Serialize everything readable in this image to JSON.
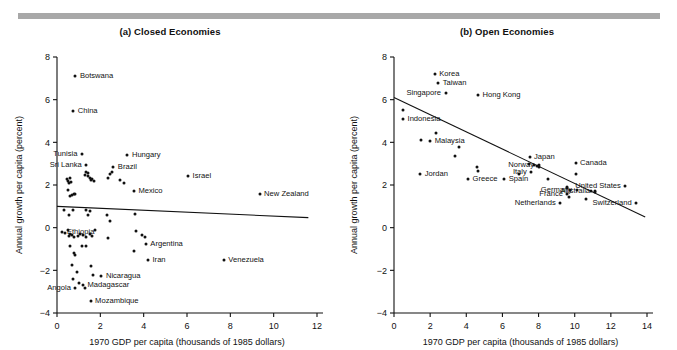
{
  "figure": {
    "top_rule_color": "#a8a8a8",
    "axis_color": "#111111",
    "point_color": "#111111"
  },
  "chart_data": [
    {
      "type": "scatter",
      "panel": "a",
      "title": "(a) Closed Economies",
      "xlabel": "1970 GDP per capita (thousands of 1985 dollars)",
      "ylabel": "Annual growth per capita (percent)",
      "xlim": [
        0,
        12
      ],
      "ylim": [
        -4,
        8
      ],
      "xticks": [
        0,
        2,
        4,
        6,
        8,
        10,
        12
      ],
      "yticks": [
        -4,
        -2,
        0,
        2,
        4,
        6,
        8
      ],
      "xtick_labels": [
        "0",
        "2",
        "4",
        "6",
        "8",
        "10",
        "12"
      ],
      "ytick_labels": [
        "-4",
        "-2",
        "0",
        "2",
        "4",
        "6",
        "8"
      ],
      "grid": false,
      "legend": "none",
      "trendline": {
        "x0": 0,
        "y0": 1.0,
        "x1": 11.6,
        "y1": 0.47
      },
      "labeled_points": [
        {
          "name": "Botswana",
          "x": 0.85,
          "y": 7.1,
          "side": "right"
        },
        {
          "name": "China",
          "x": 0.75,
          "y": 5.45,
          "side": "right"
        },
        {
          "name": "Tunisia",
          "x": 1.15,
          "y": 3.45,
          "side": "left"
        },
        {
          "name": "Sri Lanka",
          "x": 1.35,
          "y": 2.95,
          "side": "left"
        },
        {
          "name": "Hungary",
          "x": 3.25,
          "y": 3.4,
          "side": "right"
        },
        {
          "name": "Brazil",
          "x": 2.6,
          "y": 2.85,
          "side": "right"
        },
        {
          "name": "Mexico",
          "x": 3.55,
          "y": 1.7,
          "side": "right"
        },
        {
          "name": "Israel",
          "x": 6.05,
          "y": 2.4,
          "side": "right"
        },
        {
          "name": "New Zealand",
          "x": 9.35,
          "y": 1.6,
          "side": "right"
        },
        {
          "name": "Ethiopia",
          "x": 0.25,
          "y": -0.2,
          "side": "right"
        },
        {
          "name": "Argentina",
          "x": 4.1,
          "y": -0.75,
          "side": "right"
        },
        {
          "name": "Iran",
          "x": 4.2,
          "y": -1.5,
          "side": "right"
        },
        {
          "name": "Venezuela",
          "x": 7.7,
          "y": -1.5,
          "side": "right"
        },
        {
          "name": "Nicaragua",
          "x": 2.05,
          "y": -2.25,
          "side": "right"
        },
        {
          "name": "Madagascar",
          "x": 1.2,
          "y": -2.7,
          "side": "right"
        },
        {
          "name": "Angola",
          "x": 0.85,
          "y": -2.85,
          "side": "left"
        },
        {
          "name": "Mozambique",
          "x": 1.55,
          "y": -3.45,
          "side": "right"
        }
      ],
      "unlabeled_points": [
        [
          0.45,
          2.3
        ],
        [
          0.5,
          2.2
        ],
        [
          0.6,
          2.35
        ],
        [
          0.55,
          2.1
        ],
        [
          0.65,
          2.15
        ],
        [
          0.5,
          1.75
        ],
        [
          0.7,
          1.55
        ],
        [
          0.78,
          1.6
        ],
        [
          0.85,
          1.6
        ],
        [
          0.62,
          1.5
        ],
        [
          1.35,
          2.6
        ],
        [
          1.42,
          2.4
        ],
        [
          1.5,
          2.35
        ],
        [
          1.55,
          2.25
        ],
        [
          1.62,
          2.3
        ],
        [
          1.45,
          2.55
        ],
        [
          1.7,
          2.2
        ],
        [
          1.3,
          2.45
        ],
        [
          2.35,
          2.35
        ],
        [
          2.45,
          2.5
        ],
        [
          2.55,
          2.6
        ],
        [
          3.1,
          2.1
        ],
        [
          2.9,
          2.25
        ],
        [
          0.3,
          0.85
        ],
        [
          0.55,
          0.6
        ],
        [
          0.72,
          0.85
        ],
        [
          1.35,
          0.85
        ],
        [
          1.5,
          0.8
        ],
        [
          1.45,
          0.6
        ],
        [
          2.3,
          0.6
        ],
        [
          2.45,
          0.3
        ],
        [
          3.6,
          0.65
        ],
        [
          0.35,
          -0.25
        ],
        [
          0.55,
          -0.4
        ],
        [
          0.62,
          -0.3
        ],
        [
          0.7,
          -0.35
        ],
        [
          0.8,
          -0.45
        ],
        [
          0.95,
          -0.4
        ],
        [
          1.05,
          -0.3
        ],
        [
          1.2,
          -0.35
        ],
        [
          1.35,
          -0.45
        ],
        [
          1.5,
          -0.3
        ],
        [
          1.6,
          -0.4
        ],
        [
          1.75,
          -0.1
        ],
        [
          2.35,
          -0.5
        ],
        [
          3.65,
          -0.15
        ],
        [
          3.9,
          -0.35
        ],
        [
          4.05,
          -0.45
        ],
        [
          3.55,
          -1.1
        ],
        [
          0.6,
          -0.85
        ],
        [
          0.8,
          -1.2
        ],
        [
          0.85,
          -1.3
        ],
        [
          1.15,
          -0.85
        ],
        [
          1.35,
          -0.85
        ],
        [
          0.7,
          -1.75
        ],
        [
          0.9,
          -2.1
        ],
        [
          1.55,
          -1.8
        ],
        [
          1.65,
          -2.2
        ],
        [
          0.75,
          -2.4
        ],
        [
          1.0,
          -2.6
        ],
        [
          1.3,
          -2.85
        ],
        [
          0.5,
          -0.1
        ]
      ]
    },
    {
      "type": "scatter",
      "panel": "b",
      "title": "(b) Open Economies",
      "xlabel": "1970 GDP per capita (thousands of 1985 dollars)",
      "ylabel": "Annual growth per capita (percent)",
      "xlim": [
        0,
        14
      ],
      "ylim": [
        -4,
        8
      ],
      "xticks": [
        0,
        2,
        4,
        6,
        8,
        10,
        12,
        14
      ],
      "yticks": [
        -4,
        -2,
        0,
        2,
        4,
        6,
        8
      ],
      "xtick_labels": [
        "0",
        "2",
        "4",
        "6",
        "8",
        "10",
        "12",
        "14"
      ],
      "ytick_labels": [
        "-4",
        "-2",
        "0",
        "2",
        "4",
        "6",
        "8"
      ],
      "grid": false,
      "legend": "none",
      "trendline": {
        "x0": 0,
        "y0": 6.1,
        "x1": 13.9,
        "y1": 0.5
      },
      "labeled_points": [
        {
          "name": "Korea",
          "x": 2.25,
          "y": 7.2,
          "side": "right"
        },
        {
          "name": "Taiwan",
          "x": 2.45,
          "y": 6.8,
          "side": "right"
        },
        {
          "name": "Singapore",
          "x": 2.85,
          "y": 6.3,
          "side": "left"
        },
        {
          "name": "Hong Kong",
          "x": 4.65,
          "y": 6.2,
          "side": "right"
        },
        {
          "name": "Indonesia",
          "x": 0.5,
          "y": 5.1,
          "side": "right"
        },
        {
          "name": "Malaysia",
          "x": 2.0,
          "y": 4.05,
          "side": "right"
        },
        {
          "name": "Jordan",
          "x": 1.45,
          "y": 2.5,
          "side": "right"
        },
        {
          "name": "Greece",
          "x": 4.1,
          "y": 2.3,
          "side": "right"
        },
        {
          "name": "Japan",
          "x": 7.5,
          "y": 3.3,
          "side": "right"
        },
        {
          "name": "Norway",
          "x": 8.0,
          "y": 2.95,
          "side": "left"
        },
        {
          "name": "Italy",
          "x": 7.6,
          "y": 2.6,
          "side": "left"
        },
        {
          "name": "Spain",
          "x": 6.1,
          "y": 2.3,
          "side": "right"
        },
        {
          "name": "Canada",
          "x": 10.05,
          "y": 3.05,
          "side": "right"
        },
        {
          "name": "United States",
          "x": 12.8,
          "y": 1.95,
          "side": "left"
        },
        {
          "name": "Germany",
          "x": 10.1,
          "y": 1.75,
          "side": "left"
        },
        {
          "name": "Australia",
          "x": 11.1,
          "y": 1.7,
          "side": "left"
        },
        {
          "name": "France",
          "x": 9.6,
          "y": 1.6,
          "side": "left"
        },
        {
          "name": "Netherlands",
          "x": 9.2,
          "y": 1.15,
          "side": "left"
        },
        {
          "name": "Switzerland",
          "x": 13.4,
          "y": 1.15,
          "side": "left"
        }
      ],
      "unlabeled_points": [
        [
          0.5,
          5.5
        ],
        [
          2.3,
          4.45
        ],
        [
          1.5,
          4.1
        ],
        [
          3.35,
          3.35
        ],
        [
          3.6,
          3.8
        ],
        [
          4.6,
          2.85
        ],
        [
          4.65,
          2.65
        ],
        [
          7.45,
          3.0
        ],
        [
          7.75,
          2.95
        ],
        [
          7.9,
          2.9
        ],
        [
          8.05,
          2.85
        ],
        [
          8.5,
          2.3
        ],
        [
          6.9,
          2.5
        ],
        [
          10.05,
          2.5
        ],
        [
          9.6,
          1.85
        ],
        [
          9.75,
          1.75
        ],
        [
          9.7,
          1.45
        ],
        [
          10.6,
          1.35
        ],
        [
          10.9,
          1.7
        ],
        [
          11.15,
          1.65
        ],
        [
          9.55,
          1.9
        ]
      ]
    }
  ]
}
